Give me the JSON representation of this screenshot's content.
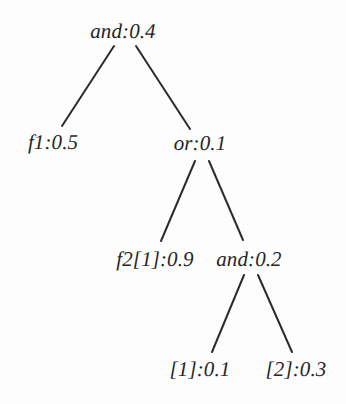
{
  "figure": {
    "kind": "expression-tree",
    "width": 346,
    "height": 404,
    "background_color": "#fdfdfd",
    "text_color": "#262626",
    "edge_color": "#2b2b2b",
    "edge_width": 2
  },
  "nodes": [
    {
      "id": "n0",
      "label": "and:0.4",
      "cx": 123,
      "cy": 31,
      "level": 0
    },
    {
      "id": "n1",
      "label": "f1:0.5",
      "cx": 53,
      "cy": 142,
      "level": 1
    },
    {
      "id": "n2",
      "label": "or:0.1",
      "cx": 200,
      "cy": 143,
      "level": 1
    },
    {
      "id": "n3",
      "label": "f2[1]:0.9",
      "cx": 155,
      "cy": 259,
      "level": 2
    },
    {
      "id": "n4",
      "label": "and:0.2",
      "cx": 249,
      "cy": 259,
      "level": 2
    },
    {
      "id": "n5",
      "label": "[1]:0.1",
      "cx": 200,
      "cy": 369,
      "level": 3
    },
    {
      "id": "n6",
      "label": "[2]:0.3",
      "cx": 296,
      "cy": 369,
      "level": 3
    }
  ],
  "edges": [
    {
      "from": "n0",
      "to": "n1",
      "x1": 114,
      "y1": 46,
      "x2": 62,
      "y2": 126
    },
    {
      "from": "n0",
      "to": "n2",
      "x1": 136,
      "y1": 46,
      "x2": 190,
      "y2": 129
    },
    {
      "from": "n2",
      "to": "n3",
      "x1": 195,
      "y1": 161,
      "x2": 161,
      "y2": 241
    },
    {
      "from": "n2",
      "to": "n4",
      "x1": 209,
      "y1": 161,
      "x2": 243,
      "y2": 240
    },
    {
      "from": "n4",
      "to": "n5",
      "x1": 244,
      "y1": 275,
      "x2": 212,
      "y2": 352
    },
    {
      "from": "n4",
      "to": "n6",
      "x1": 258,
      "y1": 275,
      "x2": 292,
      "y2": 352
    }
  ]
}
